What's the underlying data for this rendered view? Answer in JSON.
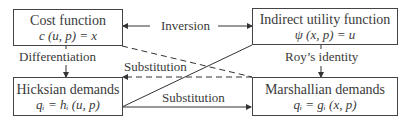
{
  "boxes": {
    "cost": {
      "title": "Cost function",
      "formula": "c (u, p) = x"
    },
    "indirect": {
      "title": "Indirect utility function",
      "formula": "ψ (x, p) = u"
    },
    "hicksian": {
      "title": "Hicksian demands",
      "formula": "qᵢ = hᵢ (u, p)"
    },
    "marshallian": {
      "title": "Marshallian demands",
      "formula": "qᵢ = gᵢ (x, p)"
    }
  },
  "edges": {
    "inversion": "Inversion",
    "differentiation": "Differentiation",
    "roys_identity": "Roy’s identity",
    "substitution_dashed": "Substitution",
    "substitution_solid": "Substitution"
  },
  "colors": {
    "line": "#333333",
    "text": "#3a3a3a"
  }
}
